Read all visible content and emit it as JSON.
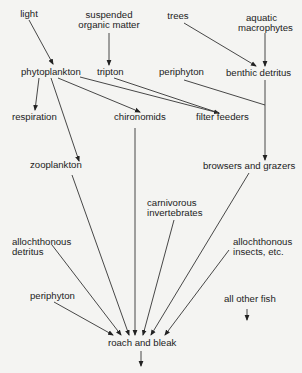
{
  "diagram": {
    "nodes": {
      "light": "light",
      "suspended_om_1": "suspended",
      "suspended_om_2": "organic matter",
      "trees": "trees",
      "aquatic_1": "aquatic",
      "aquatic_2": "macrophytes",
      "phytoplankton": "phytoplankton",
      "tripton": "tripton",
      "periphyton_top": "periphyton",
      "benthic_detritus": "benthic  detritus",
      "respiration": "respiration",
      "chironomids": "chironomids",
      "filter_feeders": "filter feeders",
      "zooplankton": "zooplankton",
      "browsers_grazers": "browsers and grazers",
      "carnivorous_1": "carnivorous",
      "carnivorous_2": "invertebrates",
      "alloch_detritus_1": "allochthonous",
      "alloch_detritus_2": "detritus",
      "alloch_insects_1": "allochthonous",
      "alloch_insects_2": "insects, etc.",
      "periphyton_bottom": "periphyton",
      "all_other_fish": "all other fish",
      "roach_bleak": "roach and bleak"
    },
    "edges": [
      {
        "from": "light",
        "to": "phytoplankton"
      },
      {
        "from": "suspended organic matter",
        "to": "tripton"
      },
      {
        "from": "trees",
        "to": "benthic detritus"
      },
      {
        "from": "aquatic macrophytes",
        "to": "benthic detritus"
      },
      {
        "from": "phytoplankton",
        "to": "respiration"
      },
      {
        "from": "phytoplankton",
        "to": "zooplankton"
      },
      {
        "from": "phytoplankton",
        "to": "chironomids"
      },
      {
        "from": "phytoplankton",
        "to": "filter feeders"
      },
      {
        "from": "tripton",
        "to": "filter feeders"
      },
      {
        "from": "periphyton",
        "to": "browsers and grazers"
      },
      {
        "from": "benthic detritus",
        "to": "browsers and grazers"
      },
      {
        "from": "zooplankton",
        "to": "roach and bleak"
      },
      {
        "from": "chironomids",
        "to": "roach and bleak"
      },
      {
        "from": "browsers and grazers",
        "to": "roach and bleak"
      },
      {
        "from": "carnivorous invertebrates",
        "to": "roach and bleak"
      },
      {
        "from": "allochthonous detritus",
        "to": "roach and bleak"
      },
      {
        "from": "allochthonous insects, etc.",
        "to": "roach and bleak"
      },
      {
        "from": "periphyton",
        "to": "roach and bleak"
      },
      {
        "from": "all other fish",
        "to": "out"
      },
      {
        "from": "roach and bleak",
        "to": "out"
      }
    ]
  }
}
